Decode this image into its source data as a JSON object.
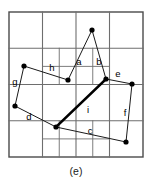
{
  "figure": {
    "caption": "(e)",
    "type": "grid-polygon-diagram",
    "colors": {
      "background": "#ffffff",
      "grid_line": "#6e6e6e",
      "frame_line": "#4a4a4a",
      "edge_line": "#1a1a1a",
      "bold_edge_line": "#000000",
      "vertex_fill": "#000000",
      "label_text": "#000000",
      "caption_text": "#1a1a1a"
    },
    "frame": {
      "x": 9,
      "y": 12,
      "width": 134,
      "height": 145
    },
    "grid": {
      "columns": 4,
      "rows": 4,
      "cell_width": 33.5,
      "cell_height": 36.25,
      "main_vertical_lines": [
        42.5,
        76,
        109.5
      ],
      "main_horizontal_lines": [
        48.25,
        84.5,
        120.75
      ],
      "subdivisions": [
        {
          "name": "cell-r1c2-split",
          "verticals": [
            59.25
          ],
          "horizontals": [
            66.4
          ],
          "x": 42.5,
          "y": 48.25,
          "width": 33.5,
          "height": 36.25
        },
        {
          "name": "cell-r1c3-split",
          "verticals": [
            92.75
          ],
          "horizontals": [
            66.4
          ],
          "x": 76,
          "y": 48.25,
          "width": 33.5,
          "height": 36.25
        },
        {
          "name": "cell-r3c1-split",
          "verticals": [
            59.25
          ],
          "horizontals": [
            138.9
          ],
          "x": 42.5,
          "y": 120.75,
          "width": 33.5,
          "height": 36.25
        },
        {
          "name": "cell-r3c2-split",
          "verticals": [
            92.75
          ],
          "horizontals": [
            138.9
          ],
          "x": 76,
          "y": 120.75,
          "width": 33.5,
          "height": 36.25
        }
      ]
    },
    "vertices": [
      {
        "id": "v1",
        "x": 92,
        "y": 30
      },
      {
        "id": "v2",
        "x": 68,
        "y": 80
      },
      {
        "id": "v3",
        "x": 106,
        "y": 79
      },
      {
        "id": "v4",
        "x": 132,
        "y": 84
      },
      {
        "id": "v5",
        "x": 126,
        "y": 142
      },
      {
        "id": "v6",
        "x": 56,
        "y": 127
      },
      {
        "id": "v7",
        "x": 15,
        "y": 106
      },
      {
        "id": "v8",
        "x": 24,
        "y": 66
      }
    ],
    "edges": [
      {
        "label": "a",
        "from": "v1",
        "to": "v2",
        "bold": false,
        "label_x": 79,
        "label_y": 62
      },
      {
        "label": "b",
        "from": "v1",
        "to": "v3",
        "bold": false,
        "label_x": 99,
        "label_y": 62
      },
      {
        "label": "c",
        "from": "v6",
        "to": "v5",
        "bold": false,
        "label_x": 90,
        "label_y": 131
      },
      {
        "label": "d",
        "from": "v7",
        "to": "v6",
        "bold": false,
        "label_x": 29,
        "label_y": 117
      },
      {
        "label": "e",
        "from": "v3",
        "to": "v4",
        "bold": false,
        "label_x": 118,
        "label_y": 74
      },
      {
        "label": "f",
        "from": "v4",
        "to": "v5",
        "bold": false,
        "label_x": 125,
        "label_y": 113
      },
      {
        "label": "g",
        "from": "v8",
        "to": "v7",
        "bold": false,
        "label_x": 15,
        "label_y": 82
      },
      {
        "label": "h",
        "from": "v8",
        "to": "v2",
        "bold": false,
        "label_x": 52,
        "label_y": 68
      },
      {
        "label": "i",
        "from": "v3",
        "to": "v6",
        "bold": true,
        "label_x": 88,
        "label_y": 110
      }
    ]
  }
}
